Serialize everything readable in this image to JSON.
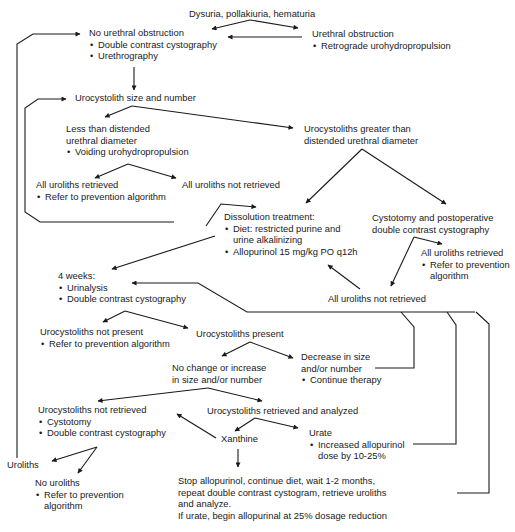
{
  "diagram": {
    "type": "clinical-algorithm-flowchart",
    "colors": {
      "line": "#1a1a1a",
      "text": "#1a1a1a",
      "background": "#ffffff"
    },
    "nodes": {
      "start": {
        "title": "Dysuria, pollakiuria, hematuria"
      },
      "no_obstruction": {
        "title": "No urethral obstruction",
        "bullets": [
          "Double contrast cystography",
          "Urethrography"
        ]
      },
      "obstruction": {
        "title": "Urethral obstruction",
        "bullets": [
          "Retrograde urohydropropulsion"
        ]
      },
      "size_number": {
        "title": "Urocystolith size and number"
      },
      "less_than": {
        "title_lines": [
          "Less than distended",
          "urethral diameter"
        ],
        "bullets": [
          "Voiding urohydropropulsion"
        ]
      },
      "greater_than": {
        "title_lines": [
          "Urocystoliths greater than",
          "distended urethral diameter"
        ]
      },
      "all_retrieved_1": {
        "title": "All uroliths retrieved",
        "bullets": [
          "Refer to prevention algorithm"
        ]
      },
      "not_retrieved_1": {
        "title": "All uroliths not retrieved"
      },
      "dissolution": {
        "title": "Dissolution treatment:",
        "bullets": [
          [
            "Diet: restricted purine and",
            "urine alkalinizing"
          ],
          [
            "Allopurinol 15 mg/kg PO q12h"
          ]
        ]
      },
      "cystotomy_post": {
        "title_lines": [
          "Cystotomy and postoperative",
          "double contrast cystography"
        ]
      },
      "all_retrieved_2": {
        "title": "All uroliths retrieved",
        "bullets": [
          [
            "Refer to prevention",
            "algorithm"
          ]
        ]
      },
      "four_weeks": {
        "title": "4 weeks:",
        "bullets": [
          "Urinalysis",
          "Double contrast cystography"
        ]
      },
      "not_retrieved_2": {
        "title": "All uroliths not retrieved"
      },
      "not_present": {
        "title": "Urocystoliths not present",
        "bullets": [
          "Refer to prevention algorithm"
        ]
      },
      "present": {
        "title": "Urocystoliths present"
      },
      "no_change": {
        "title_lines": [
          "No change or increase",
          "in size and/or number"
        ]
      },
      "decrease": {
        "title_lines": [
          "Decrease in size",
          "and/or number"
        ],
        "bullets": [
          "Continue therapy"
        ]
      },
      "uc_not_retrieved": {
        "title": "Urocystoliths not retrieved",
        "bullets": [
          "Cystotomy",
          "Double contrast cystography"
        ]
      },
      "uc_retrieved": {
        "title": "Urocystoliths retrieved and analyzed"
      },
      "xanthine": {
        "title": "Xanthine"
      },
      "urate": {
        "title": "Urate",
        "bullets": [
          [
            "Increased allopurinol",
            "dose by 10-25%"
          ]
        ]
      },
      "uroliths": {
        "title": "Uroliths"
      },
      "no_uroliths": {
        "title": "No uroliths",
        "bullets": [
          [
            "Refer to prevention",
            "algorithm"
          ]
        ]
      },
      "stop": {
        "lines": [
          "Stop allopurinol, continue diet, wait 1-2 months,",
          "repeat double contrast cystogram, retrieve uroliths",
          "and analyze.",
          "If urate, begin allopurinal at 25% dosage reduction"
        ]
      }
    }
  }
}
